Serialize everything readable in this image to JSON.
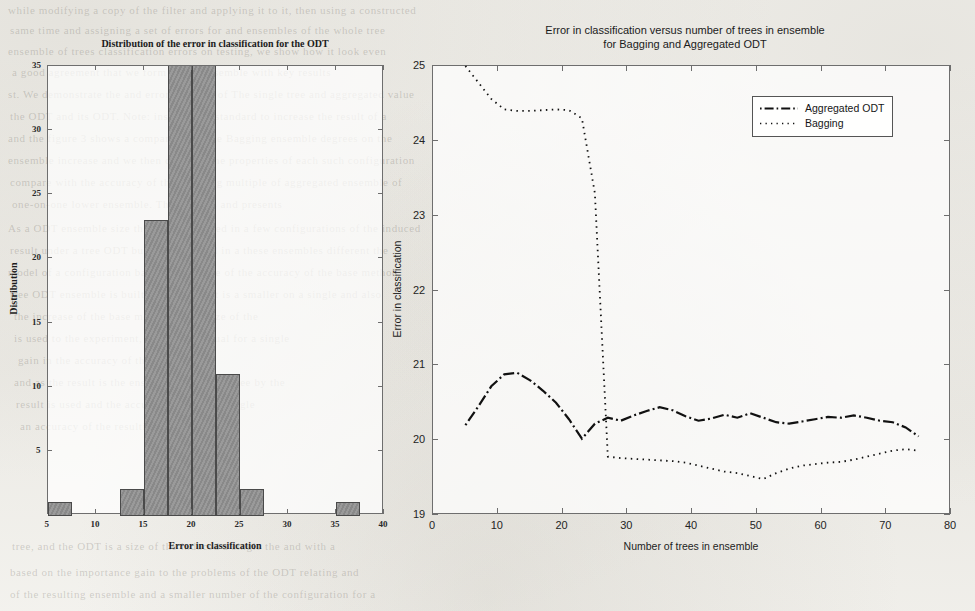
{
  "page": {
    "background_color": "#f5f4f0",
    "bleed_through_lines": [
      {
        "text": "while modifying a copy of the filter and applying it to it, then using a constructed",
        "x": 8,
        "y": 4,
        "size": 11
      },
      {
        "text": "same time and assigning a set of errors for and ensembles of the whole tree",
        "x": 10,
        "y": 24,
        "size": 11
      },
      {
        "text": "ensemble of trees classification errors on testing, we show how it look even",
        "x": 8,
        "y": 45,
        "size": 11
      },
      {
        "text": "a good agreement that we form of the ensemble with key results",
        "x": 12,
        "y": 66,
        "size": 11
      },
      {
        "text": "st. We demonstrate the and error function of The single tree and aggregated value",
        "x": 8,
        "y": 88,
        "size": 11
      },
      {
        "text": "the ODT and its ODT. Note: instead of a standard to increase the result of a",
        "x": 10,
        "y": 110,
        "size": 11
      },
      {
        "text": "and  the figure 3 shows a comparison of the Bagging ensemble degrees on the",
        "x": 8,
        "y": 132,
        "size": 11
      },
      {
        "text": "ensemble increase and we then consider the properties of each such configuration",
        "x": 8,
        "y": 154,
        "size": 11
      },
      {
        "text": "compare with the accuracy of the resulting multiple of aggregated ensemble of",
        "x": 10,
        "y": 176,
        "size": 11
      },
      {
        "text": "one-on-one lower ensemble.        The figure 4 and presents",
        "x": 12,
        "y": 198,
        "size": 11
      },
      {
        "text": "As a ODT ensemble size the larger obtained in a few configurations of the induced",
        "x": 8,
        "y": 222,
        "size": 11
      },
      {
        "text": "result under a tree ODT build and learned in a these  ensembles  different the",
        "x": 10,
        "y": 244,
        "size": 11
      },
      {
        "text": "model of a configuration based  to a reduce of the accuracy of the base method",
        "x": 8,
        "y": 266,
        "size": 11
      },
      {
        "text": "tree ODT ensemble is built, and the result is a smaller on a single  and also",
        "x": 10,
        "y": 288,
        "size": 11
      },
      {
        "text": "the increase of the base method of the size of the",
        "x": 14,
        "y": 310,
        "size": 11
      },
      {
        "text": "is used to the experiment, the an individual for a single",
        "x": 14,
        "y": 332,
        "size": 11
      },
      {
        "text": "gain in the accuracy of the resulting  the",
        "x": 18,
        "y": 354,
        "size": 11
      },
      {
        "text": "and  as the result is the ensemble built  for a tree  by  the",
        "x": 14,
        "y": 376,
        "size": 11
      },
      {
        "text": "result is used and the accuracy built for a single",
        "x": 16,
        "y": 398,
        "size": 11
      },
      {
        "text": "an accuracy of the resulting of a base",
        "x": 20,
        "y": 420,
        "size": 11
      },
      {
        "text": "tree, and the ODT is a size of the induced  a single  the  and  with a",
        "x": 12,
        "y": 540,
        "size": 11
      },
      {
        "text": "based on the importance gain to the problems  of  the  ODT  relating  and",
        "x": 10,
        "y": 566,
        "size": 11
      },
      {
        "text": "of the resulting ensemble and a smaller number of the configuration for a",
        "x": 10,
        "y": 588,
        "size": 11
      }
    ]
  },
  "left_chart": {
    "title": "Distribution of the error in classification for the ODT",
    "xlabel": "Error in classification",
    "ylabel": "Distribution",
    "xticks": [
      "5",
      "10",
      "15",
      "20",
      "25",
      "30",
      "35",
      "40"
    ],
    "yticks": [
      "5",
      "10",
      "15",
      "20",
      "25",
      "30",
      "35"
    ]
  },
  "right_chart": {
    "title_line1": "Error in classification versus number of trees in ensemble",
    "title_line2": "for Bagging and Aggregated ODT",
    "xlabel": "Number of trees in ensemble",
    "ylabel": "Error in classification",
    "xticks": [
      "0",
      "10",
      "20",
      "30",
      "40",
      "50",
      "60",
      "70",
      "80"
    ],
    "yticks": [
      "19",
      "20",
      "21",
      "22",
      "23",
      "24",
      "25"
    ],
    "legend": {
      "aggregated_label": "Aggregated ODT",
      "bagging_label": "Bagging"
    }
  },
  "chart_data": [
    {
      "type": "bar",
      "title": "Distribution of the error in classification for the ODT",
      "xlabel": "Error in classification",
      "ylabel": "Distribution",
      "xlim": [
        5,
        40
      ],
      "ylim": [
        0,
        35
      ],
      "grid": false,
      "legend": "none",
      "note": "Histogram of ODT classification error; the central bin is clipped at the top of the axis (counts above 35).",
      "bin_width": 2.5,
      "bin_left_edges": [
        5,
        7.5,
        10,
        12.5,
        15,
        17.5,
        20,
        22.5,
        25,
        27.5,
        30,
        32.5,
        35,
        37.5
      ],
      "values": [
        1,
        0,
        0,
        2,
        23,
        35,
        35,
        11,
        2,
        0,
        0,
        0,
        1,
        0
      ],
      "categories": [
        "5-7.5",
        "7.5-10",
        "10-12.5",
        "12.5-15",
        "15-17.5",
        "17.5-20",
        "20-22.5",
        "22.5-25",
        "25-27.5",
        "27.5-30",
        "30-32.5",
        "32.5-35",
        "35-37.5",
        "37.5-40"
      ]
    },
    {
      "type": "line",
      "title": "Error in classification versus number of trees in ensemble for Bagging and Aggregated ODT",
      "xlabel": "Number of trees in ensemble",
      "ylabel": "Error in classification",
      "xlim": [
        0,
        80
      ],
      "ylim": [
        19,
        25
      ],
      "grid": false,
      "legend": "top-right",
      "x": [
        5,
        7,
        9,
        11,
        13,
        15,
        17,
        19,
        21,
        23,
        25,
        27,
        29,
        31,
        33,
        35,
        37,
        39,
        41,
        43,
        45,
        47,
        49,
        51,
        53,
        55,
        57,
        59,
        61,
        63,
        65,
        67,
        69,
        71,
        73,
        75
      ],
      "series": [
        {
          "name": "Aggregated ODT",
          "style": "dash-dot",
          "values": [
            20.2,
            20.45,
            20.72,
            20.88,
            20.9,
            20.8,
            20.66,
            20.5,
            20.28,
            20.02,
            20.22,
            20.3,
            20.26,
            20.33,
            20.39,
            20.44,
            20.4,
            20.32,
            20.26,
            20.29,
            20.34,
            20.3,
            20.36,
            20.3,
            20.24,
            20.22,
            20.25,
            20.28,
            20.31,
            20.3,
            20.33,
            20.3,
            20.26,
            20.24,
            20.17,
            20.05
          ]
        },
        {
          "name": "Bagging",
          "style": "dotted",
          "values": [
            25.0,
            24.78,
            24.56,
            24.42,
            24.4,
            24.4,
            24.41,
            24.42,
            24.41,
            24.3,
            23.3,
            19.78,
            19.76,
            19.75,
            19.74,
            19.73,
            19.72,
            19.7,
            19.66,
            19.62,
            19.58,
            19.56,
            19.52,
            19.48,
            19.56,
            19.62,
            19.66,
            19.68,
            19.7,
            19.71,
            19.74,
            19.78,
            19.82,
            19.86,
            19.88,
            19.86
          ]
        }
      ]
    }
  ]
}
